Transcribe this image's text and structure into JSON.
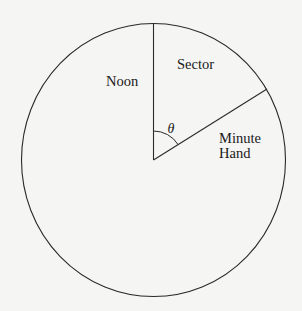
{
  "diagram": {
    "title": "",
    "type": "clock-sector",
    "colors": {
      "background": "#f5f5f4",
      "stroke": "#2a2a2a",
      "text": "#1a1a1a"
    },
    "circle": {
      "cx": 153.5,
      "cy": 160,
      "rx": 132,
      "ry": 136.5
    },
    "noon_line": {
      "x1": 153.5,
      "y1": 160,
      "x2": 153.5,
      "y2": 23.5
    },
    "minute_hand_line": {
      "x1": 153.5,
      "y1": 160,
      "x2": 267,
      "y2": 89
    },
    "angle_arc": {
      "radius": 29
    },
    "labels": {
      "noon": "Noon",
      "sector": "Sector",
      "minute_hand_line1": "Minute",
      "minute_hand_line2": "Hand",
      "angle": "θ"
    }
  }
}
